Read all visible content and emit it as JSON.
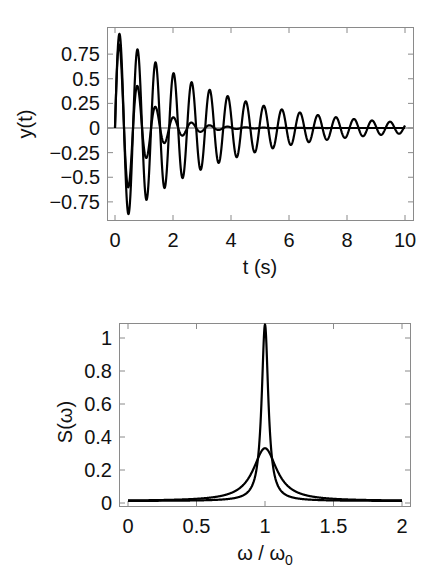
{
  "chart_data": [
    {
      "type": "line",
      "title": "",
      "xlabel": "t (s)",
      "ylabel": "y(t)",
      "xlim": [
        0,
        10
      ],
      "ylim": [
        -0.9,
        0.97
      ],
      "x_ticks": [
        0,
        2,
        4,
        6,
        8,
        10
      ],
      "x_tick_labels": [
        "0",
        "2",
        "4",
        "6",
        "8",
        "10"
      ],
      "y_ticks": [
        0.75,
        0.5,
        0.25,
        0,
        -0.25,
        -0.5,
        -0.75
      ],
      "y_tick_labels": [
        "0.75",
        "0.5",
        "0.25",
        "0",
        "−0.25",
        "−0.5",
        "−0.75"
      ],
      "grid": false,
      "zero_line": true,
      "legend": null,
      "series": [
        {
          "name": "lightly damped",
          "model": "y = A exp(-gamma t) sin(omega t)",
          "params": {
            "A": 1.0,
            "gamma": 0.29,
            "omega": 10.1
          },
          "peaks": [
            [
              0.15,
              0.94
            ],
            [
              0.78,
              0.78
            ],
            [
              1.4,
              0.65
            ],
            [
              2.0,
              0.54
            ],
            [
              2.65,
              0.45
            ],
            [
              3.3,
              0.37
            ],
            [
              3.9,
              0.31
            ],
            [
              4.5,
              0.26
            ],
            [
              5.2,
              0.22
            ],
            [
              5.8,
              0.18
            ],
            [
              6.4,
              0.15
            ],
            [
              7.1,
              0.12
            ],
            [
              7.7,
              0.1
            ],
            [
              8.3,
              0.09
            ],
            [
              9.0,
              0.07
            ],
            [
              9.6,
              0.06
            ]
          ]
        },
        {
          "name": "heavily damped",
          "model": "y = A exp(-gamma t) sin(omega t)",
          "params": {
            "A": 1.0,
            "gamma": 1.1,
            "omega": 10.1
          },
          "peaks": [
            [
              0.15,
              0.85
            ],
            [
              0.78,
              0.45
            ],
            [
              1.4,
              0.22
            ],
            [
              2.0,
              0.12
            ],
            [
              2.65,
              0.06
            ],
            [
              3.3,
              0.03
            ],
            [
              3.9,
              0.02
            ]
          ]
        }
      ]
    },
    {
      "type": "line",
      "title": "",
      "xlabel": "ω / ω₀",
      "ylabel": "S(ω)",
      "xlim": [
        0,
        2
      ],
      "ylim": [
        -0.02,
        1.1
      ],
      "x_ticks": [
        0,
        0.5,
        1,
        1.5,
        2
      ],
      "x_tick_labels": [
        "0",
        "0.5",
        "1",
        "1.5",
        "2"
      ],
      "y_ticks": [
        0,
        0.2,
        0.4,
        0.6,
        0.8,
        1
      ],
      "y_tick_labels": [
        "0",
        "0.2",
        "0.4",
        "0.6",
        "0.8",
        "1"
      ],
      "grid": false,
      "legend": null,
      "series": [
        {
          "name": "narrow resonance",
          "model": "Lorentzian",
          "params": {
            "center": 1.0,
            "peak": 1.07,
            "hwhm": 0.029
          },
          "peak_value": 1.07
        },
        {
          "name": "broad resonance",
          "model": "Lorentzian",
          "params": {
            "center": 1.0,
            "peak": 0.32,
            "hwhm": 0.105
          },
          "peak_value": 0.32
        }
      ]
    }
  ]
}
